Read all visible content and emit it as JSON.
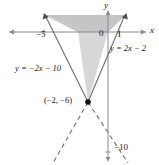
{
  "figure": {
    "type": "coordinate-plane-graph"
  },
  "axes": {
    "x_label": "x",
    "y_label": "y",
    "origin_label": "0"
  },
  "ticks": {
    "x": [
      {
        "label": "−5",
        "value": -5
      },
      {
        "label": "1",
        "value": 1
      }
    ],
    "y": [
      {
        "label": "−10",
        "value": -10
      }
    ]
  },
  "lines": [
    {
      "name": "line-right",
      "equation_label": "y = 2x − 2",
      "slope": 2,
      "intercept": -2,
      "style_above_vertex": "solid",
      "style_below_vertex": "dashed"
    },
    {
      "name": "line-left",
      "equation_label": "y = −2x − 10",
      "slope": -2,
      "intercept": -10,
      "style_above_vertex": "solid",
      "style_below_vertex": "dashed"
    }
  ],
  "points": [
    {
      "name": "intersection-point",
      "label": "(−2, −6)",
      "x": -2,
      "y": -6
    }
  ],
  "shading": {
    "region_label": "shaded-solution-region",
    "fill_above_axis": "#c9c9c9",
    "fill_below_axis": "#d9d9d9",
    "stroke": "#6e6e6e"
  },
  "colors": {
    "axis": "#7a7a7a",
    "line": "#6e6e6e",
    "text": "#1a1a1a",
    "background": "#ffffff"
  }
}
